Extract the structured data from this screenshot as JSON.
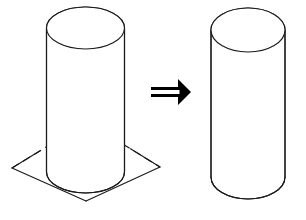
{
  "figure": {
    "title": "Cylinder intersecting a plane transforms into a cylinder",
    "background_color": "#ffffff",
    "stroke_color": "#1a1a1a",
    "arrow_color": "#000000",
    "width": 306,
    "height": 220
  },
  "left_figure": {
    "name": "cylinder-intersecting-plane",
    "label": "",
    "cylinder": {
      "name": "cylinder-left",
      "center_x": 85.5,
      "top_center_y": 28,
      "bottom_center_y": 172,
      "radius_x": 39,
      "radius_y": 21,
      "top_ellipse_visible": true,
      "bottom_ellipse_visible": false,
      "bottom_front_arc_visible": true,
      "left_edge_x": 46.5,
      "right_edge_x": 124.5
    },
    "plane": {
      "name": "intersecting-plane",
      "shape": "parallelogram",
      "corners": [
        {
          "label": "top",
          "x": 87,
          "y": 122
        },
        {
          "label": "right",
          "x": 160,
          "y": 167
        },
        {
          "label": "bottom",
          "x": 86,
          "y": 201
        },
        {
          "label": "left",
          "x": 12,
          "y": 168
        }
      ],
      "hidden_edges_dashed": true,
      "fill": "none"
    }
  },
  "transform_arrow": {
    "name": "double-arrow-right",
    "symbol": "⇒",
    "x": 151,
    "y": 79,
    "width": 40,
    "height": 26,
    "direction": "right",
    "style": "double-line"
  },
  "right_figure": {
    "name": "cylinder-result",
    "label": "",
    "cylinder": {
      "name": "cylinder-right",
      "center_x": 248,
      "top_center_y": 30,
      "bottom_center_y": 177,
      "radius_x": 37,
      "radius_y": 22,
      "top_ellipse_visible": true,
      "bottom_ellipse_visible": false,
      "bottom_front_arc_visible": true,
      "left_edge_x": 211,
      "right_edge_x": 285
    }
  }
}
